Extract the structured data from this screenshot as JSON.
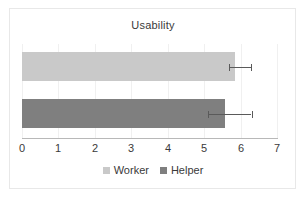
{
  "chart_data": {
    "type": "bar",
    "orientation": "horizontal",
    "title": "Usability",
    "xlabel": "",
    "ylabel": "",
    "xlim": [
      0,
      7
    ],
    "xticks": [
      "0",
      "1",
      "2",
      "3",
      "4",
      "5",
      "6",
      "7"
    ],
    "grid": true,
    "legend_position": "bottom",
    "categories": [
      "Worker",
      "Helper"
    ],
    "series": [
      {
        "name": "Worker",
        "value": 5.85,
        "color": "#c9c9c9",
        "error_low": 5.69,
        "error_high": 6.29
      },
      {
        "name": "Helper",
        "value": 5.58,
        "color": "#7f7f7f",
        "error_low": 5.1,
        "error_high": 6.3
      }
    ]
  },
  "chart": {
    "title": "Usability",
    "axis": {
      "tick_0": "0",
      "tick_1": "1",
      "tick_2": "2",
      "tick_3": "3",
      "tick_4": "4",
      "tick_5": "5",
      "tick_6": "6",
      "tick_7": "7"
    },
    "legend": {
      "worker_label": "Worker",
      "helper_label": "Helper"
    }
  },
  "colors": {
    "worker": "#c9c9c9",
    "helper": "#7f7f7f",
    "gridline": "#f0f0f0",
    "axis": "#b8b8b8",
    "error": "#5a5a5a",
    "text": "#3a3a3a",
    "frame": "#e8e8e8"
  }
}
